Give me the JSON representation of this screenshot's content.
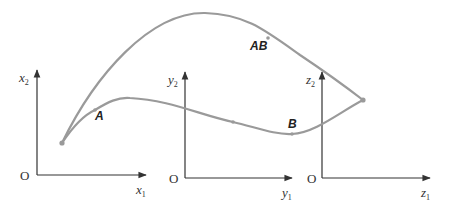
{
  "diagram": {
    "colors": {
      "axis": "#333333",
      "curve": "#9a9a9a",
      "label": "#222222"
    },
    "axes": [
      {
        "id": "x",
        "origin_label": "O",
        "horizontal": {
          "symbol": "x",
          "sub": "1"
        },
        "vertical": {
          "symbol": "x",
          "sub": "2"
        }
      },
      {
        "id": "y",
        "origin_label": "O",
        "horizontal": {
          "symbol": "y",
          "sub": "1"
        },
        "vertical": {
          "symbol": "y",
          "sub": "2"
        }
      },
      {
        "id": "z",
        "origin_label": "O",
        "horizontal": {
          "symbol": "z",
          "sub": "1"
        },
        "vertical": {
          "symbol": "z",
          "sub": "2"
        }
      }
    ],
    "curves": [
      {
        "id": "upper",
        "label": "AB"
      },
      {
        "id": "lower-a",
        "label": "A"
      },
      {
        "id": "lower-b",
        "label": "B"
      }
    ]
  }
}
